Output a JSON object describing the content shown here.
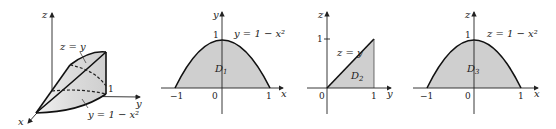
{
  "figure": {
    "panels": [
      {
        "id": "solid-3d",
        "axes": {
          "x": "x",
          "y": "y",
          "z": "z"
        },
        "labels": {
          "surface_top": "z = y",
          "surface_side": "y = 1 − x²",
          "tick_one": "1"
        }
      },
      {
        "id": "D1",
        "axes": {
          "horizontal": "x",
          "vertical": "y"
        },
        "region_label": "D",
        "region_sub": "1",
        "curve_label": "y = 1 − x²",
        "ticks": {
          "left": "−1",
          "origin": "0",
          "right": "1",
          "top": "1"
        }
      },
      {
        "id": "D2",
        "axes": {
          "horizontal": "y",
          "vertical": "z"
        },
        "region_label": "D",
        "region_sub": "2",
        "curve_label": "z = y",
        "ticks": {
          "origin": "0",
          "right": "1",
          "top": "1"
        }
      },
      {
        "id": "D3",
        "axes": {
          "horizontal": "x",
          "vertical": "z"
        },
        "region_label": "D",
        "region_sub": "3",
        "curve_label": "z = 1 − x²",
        "ticks": {
          "left": "−1",
          "origin": "0",
          "right": "1",
          "top": "1"
        }
      }
    ],
    "colors": {
      "region_fill": "#cfcfcf",
      "ink": "#111111",
      "surface": "#e4e4e4"
    }
  }
}
